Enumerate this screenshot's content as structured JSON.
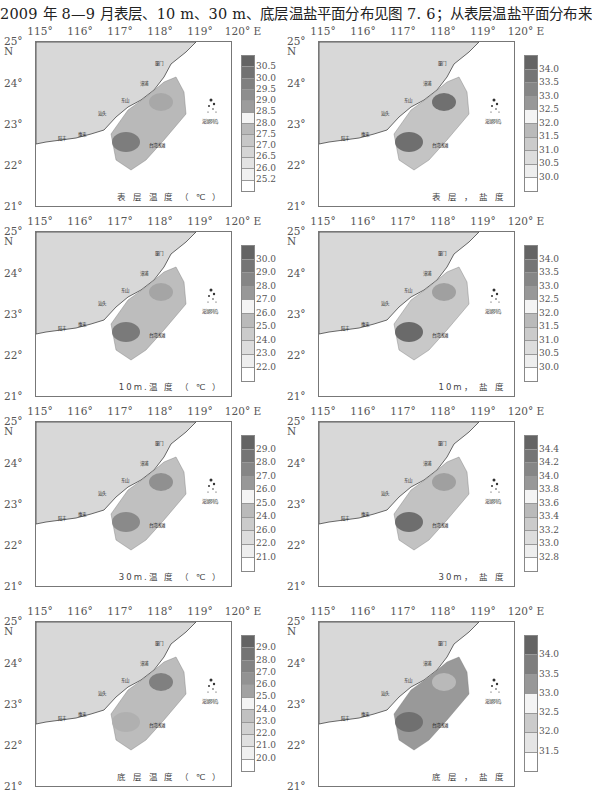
{
  "caption": "2009 年 8—9 月表层、10 m、30 m、底层温盐平面分布见图 7. 6；从表层温盐平面分布来",
  "axes": {
    "x_ticks": [
      "115°",
      "116°",
      "117°",
      "118°",
      "119°",
      "120° E"
    ],
    "y_ticks": [
      "25°",
      "N",
      "24°",
      "23°",
      "22°",
      "21°"
    ]
  },
  "places": {
    "xiamen": "厦门",
    "zhangpu": "漳浦",
    "dongshan": "东山",
    "shantou": "汕头",
    "huilai": "惠来",
    "lufeng": "陆丰",
    "taiwan_shoal": "台湾浅滩",
    "penghu": "澎湖列岛"
  },
  "panels": [
    {
      "id": "surface-temp",
      "title": "表 层 温 度 （ ℃ ）",
      "colorbar": [
        "30.5",
        "30.0",
        "29.5",
        "29.0",
        "28.5",
        "28.0",
        "27.5",
        "27.0",
        "26.5",
        "26.0",
        "25.2"
      ]
    },
    {
      "id": "surface-salinity",
      "title": "表 层 ， 盐 度",
      "colorbar": [
        "34.0",
        "33.5",
        "33.0",
        "32.5",
        "32.0",
        "31.5",
        "31.0",
        "30.5",
        "30.0"
      ]
    },
    {
      "id": "10m-temp",
      "title": "10m.温 度 （ ℃ ）",
      "colorbar": [
        "30.0",
        "29.0",
        "28.0",
        "27.0",
        "26.0",
        "25.0",
        "24.0",
        "23.0",
        "22.0"
      ]
    },
    {
      "id": "10m-salinity",
      "title": "10m， 盐 度",
      "colorbar": [
        "34.0",
        "33.5",
        "33.0",
        "32.5",
        "32.0",
        "31.5",
        "31.0",
        "30.5",
        "30.0"
      ]
    },
    {
      "id": "30m-temp",
      "title": "30m.温 度 （ ℃ ）",
      "colorbar": [
        "29.0",
        "28.0",
        "27.0",
        "26.0",
        "25.0",
        "24.0",
        "26.0",
        "22.0",
        "21.0"
      ]
    },
    {
      "id": "30m-salinity",
      "title": "30m， 盐 度",
      "colorbar": [
        "34.4",
        "34.2",
        "34.0",
        "33.8",
        "33.6",
        "33.4",
        "33.2",
        "33.0",
        "32.8"
      ],
      "bottom_ticks": [
        "15°",
        "116°",
        "117°",
        "118°",
        "119°",
        "120°E"
      ]
    },
    {
      "id": "bottom-temp",
      "title": "底 层 温 度 （ ℃ ）",
      "colorbar": [
        "29.0",
        "28.0",
        "27.0",
        "26.0",
        "25.0",
        "24.0",
        "23.0",
        "22.0",
        "21.0",
        "20.0"
      ]
    },
    {
      "id": "bottom-salinity",
      "title": "底 层 ， 盐 度",
      "colorbar": [
        "34.0",
        "33.5",
        "33.0",
        "32.5",
        "32.0",
        "31.5"
      ]
    }
  ],
  "chart_data": [
    {
      "type": "heatmap",
      "title": "表层温度 (℃)",
      "xlabel": "Longitude (°E)",
      "ylabel": "Latitude (°N)",
      "xlim": [
        115,
        120
      ],
      "ylim": [
        21,
        25
      ],
      "legend_levels": [
        30.5,
        30.0,
        29.5,
        29.0,
        28.5,
        28.0,
        27.5,
        27.0,
        26.5,
        26.0,
        25.2
      ],
      "legend_position": "right"
    },
    {
      "type": "heatmap",
      "title": "表层，盐度",
      "xlabel": "Longitude (°E)",
      "ylabel": "Latitude (°N)",
      "xlim": [
        115,
        120
      ],
      "ylim": [
        21,
        25
      ],
      "legend_levels": [
        34.0,
        33.5,
        33.0,
        32.5,
        32.0,
        31.5,
        31.0,
        30.5,
        30.0
      ],
      "legend_position": "right"
    },
    {
      "type": "heatmap",
      "title": "10m.温度 (℃)",
      "xlabel": "Longitude (°E)",
      "ylabel": "Latitude (°N)",
      "xlim": [
        115,
        120
      ],
      "ylim": [
        21,
        25
      ],
      "legend_levels": [
        30.0,
        29.0,
        28.0,
        27.0,
        26.0,
        25.0,
        24.0,
        23.0,
        22.0
      ],
      "legend_position": "right"
    },
    {
      "type": "heatmap",
      "title": "10m，盐度",
      "xlabel": "Longitude (°E)",
      "ylabel": "Latitude (°N)",
      "xlim": [
        115,
        120
      ],
      "ylim": [
        21,
        25
      ],
      "legend_levels": [
        34.0,
        33.5,
        33.0,
        32.5,
        32.0,
        31.5,
        31.0,
        30.5,
        30.0
      ],
      "legend_position": "right"
    },
    {
      "type": "heatmap",
      "title": "30m.温度 (℃)",
      "xlabel": "Longitude (°E)",
      "ylabel": "Latitude (°N)",
      "xlim": [
        115,
        120
      ],
      "ylim": [
        21,
        25
      ],
      "legend_levels": [
        29.0,
        28.0,
        27.0,
        26.0,
        25.0,
        24.0,
        26.0,
        22.0,
        21.0
      ],
      "legend_position": "right"
    },
    {
      "type": "heatmap",
      "title": "30m，盐度",
      "xlabel": "Longitude (°E)",
      "ylabel": "Latitude (°N)",
      "xlim": [
        115,
        120
      ],
      "ylim": [
        21,
        25
      ],
      "legend_levels": [
        34.4,
        34.2,
        34.0,
        33.8,
        33.6,
        33.4,
        33.2,
        33.0,
        32.8
      ],
      "legend_position": "right"
    },
    {
      "type": "heatmap",
      "title": "底层温度 (℃)",
      "xlabel": "Longitude (°E)",
      "ylabel": "Latitude (°N)",
      "xlim": [
        115,
        120
      ],
      "ylim": [
        21,
        25
      ],
      "legend_levels": [
        29.0,
        28.0,
        27.0,
        26.0,
        25.0,
        24.0,
        23.0,
        22.0,
        21.0,
        20.0
      ],
      "legend_position": "right"
    },
    {
      "type": "heatmap",
      "title": "底层，盐度",
      "xlabel": "Longitude (°E)",
      "ylabel": "Latitude (°N)",
      "xlim": [
        115,
        120
      ],
      "ylim": [
        21,
        25
      ],
      "legend_levels": [
        34.0,
        33.5,
        33.0,
        32.5,
        32.0,
        31.5
      ],
      "legend_position": "right"
    }
  ]
}
